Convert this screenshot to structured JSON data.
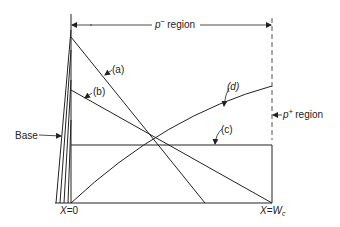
{
  "diagram": {
    "top_label": {
      "symbol": "p",
      "superscript": "−",
      "text": "region"
    },
    "right_label": {
      "symbol": "p",
      "superscript": "+",
      "text": "region"
    },
    "base_label": "Base",
    "x_left_label": {
      "var": "X",
      "eq": "=",
      "val": "0"
    },
    "x_right_label": {
      "var": "X",
      "eq": "=",
      "val": "W",
      "sub": "c"
    },
    "curves": [
      {
        "id": "a",
        "label": "(a)"
      },
      {
        "id": "b",
        "label": "(b)"
      },
      {
        "id": "c",
        "label": "(c)"
      },
      {
        "id": "d",
        "label": "(d)"
      }
    ],
    "colors": {
      "line": "#222222",
      "dashed": "#555555"
    }
  }
}
